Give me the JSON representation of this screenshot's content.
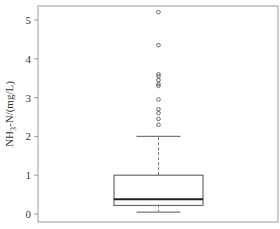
{
  "chart_data": {
    "type": "box",
    "title": "",
    "xlabel": "",
    "ylabel": "NH3-N/(mg/L)",
    "ylabel_parts": {
      "main": "NH",
      "sub": "3",
      "rest": "-N/(mg/L)"
    },
    "ylim": [
      -0.2,
      5.35
    ],
    "yticks": [
      0,
      1,
      2,
      3,
      4,
      5
    ],
    "grid": false,
    "legend": null,
    "series": [
      {
        "name": "NH3-N",
        "whisker_low": 0.05,
        "q1": 0.22,
        "median": 0.38,
        "q3": 1.0,
        "whisker_high": 2.0,
        "outliers": [
          5.2,
          4.35,
          3.6,
          3.55,
          3.45,
          3.35,
          3.3,
          2.95,
          2.7,
          2.6,
          2.45,
          2.3
        ]
      }
    ]
  },
  "colors": {
    "frame": "#9a9a9a",
    "box": "#6a6a6a",
    "median": "#222222",
    "whisker": "#777777",
    "outlier": "#666666"
  }
}
